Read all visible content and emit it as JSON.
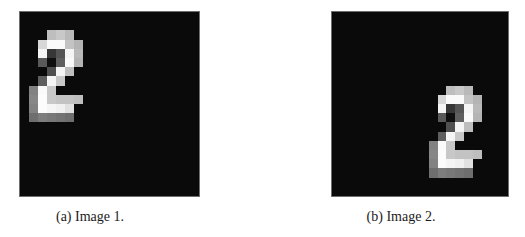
{
  "figure": {
    "panels": [
      {
        "id": "a",
        "caption": "(a) Image 1.",
        "box": {
          "left": 19,
          "top": 11,
          "width": 181,
          "height": 186
        },
        "caption_pos": {
          "cx": 90,
          "top": 209
        },
        "grid_size": 20,
        "digit": "2",
        "digit_offset": {
          "col": 0,
          "row": 0
        }
      },
      {
        "id": "b",
        "caption": "(b) Image 2.",
        "box": {
          "left": 331,
          "top": 11,
          "width": 178,
          "height": 186
        },
        "caption_pos": {
          "cx": 401,
          "top": 209
        },
        "grid_size": 20,
        "digit": "2",
        "digit_offset": {
          "col": 10,
          "row": 6
        }
      }
    ],
    "background_intensity": 10,
    "digit_pixels": [
      {
        "r": 2,
        "c": 3,
        "v": 190
      },
      {
        "r": 2,
        "c": 4,
        "v": 200
      },
      {
        "r": 2,
        "c": 5,
        "v": 185
      },
      {
        "r": 3,
        "c": 2,
        "v": 215
      },
      {
        "r": 3,
        "c": 3,
        "v": 250
      },
      {
        "r": 3,
        "c": 4,
        "v": 250
      },
      {
        "r": 3,
        "c": 5,
        "v": 195
      },
      {
        "r": 3,
        "c": 6,
        "v": 180
      },
      {
        "r": 4,
        "c": 2,
        "v": 245
      },
      {
        "r": 4,
        "c": 3,
        "v": 55
      },
      {
        "r": 4,
        "c": 4,
        "v": 85
      },
      {
        "r": 4,
        "c": 5,
        "v": 245
      },
      {
        "r": 4,
        "c": 6,
        "v": 185
      },
      {
        "r": 5,
        "c": 2,
        "v": 90
      },
      {
        "r": 5,
        "c": 3,
        "v": 15
      },
      {
        "r": 5,
        "c": 4,
        "v": 95
      },
      {
        "r": 5,
        "c": 5,
        "v": 250
      },
      {
        "r": 5,
        "c": 6,
        "v": 180
      },
      {
        "r": 6,
        "c": 3,
        "v": 80
      },
      {
        "r": 6,
        "c": 4,
        "v": 245
      },
      {
        "r": 6,
        "c": 5,
        "v": 190
      },
      {
        "r": 7,
        "c": 2,
        "v": 95
      },
      {
        "r": 7,
        "c": 3,
        "v": 245
      },
      {
        "r": 7,
        "c": 4,
        "v": 200
      },
      {
        "r": 8,
        "c": 1,
        "v": 130
      },
      {
        "r": 8,
        "c": 2,
        "v": 250
      },
      {
        "r": 8,
        "c": 3,
        "v": 200
      },
      {
        "r": 9,
        "c": 1,
        "v": 135
      },
      {
        "r": 9,
        "c": 2,
        "v": 252
      },
      {
        "r": 9,
        "c": 3,
        "v": 200
      },
      {
        "r": 9,
        "c": 4,
        "v": 195
      },
      {
        "r": 9,
        "c": 5,
        "v": 195
      },
      {
        "r": 9,
        "c": 6,
        "v": 190
      },
      {
        "r": 10,
        "c": 1,
        "v": 130
      },
      {
        "r": 10,
        "c": 2,
        "v": 252
      },
      {
        "r": 10,
        "c": 3,
        "v": 245
      },
      {
        "r": 10,
        "c": 4,
        "v": 240
      },
      {
        "r": 10,
        "c": 5,
        "v": 225
      },
      {
        "r": 11,
        "c": 1,
        "v": 110
      },
      {
        "r": 11,
        "c": 2,
        "v": 125
      },
      {
        "r": 11,
        "c": 3,
        "v": 120
      },
      {
        "r": 11,
        "c": 4,
        "v": 115
      },
      {
        "r": 11,
        "c": 5,
        "v": 110
      }
    ]
  }
}
